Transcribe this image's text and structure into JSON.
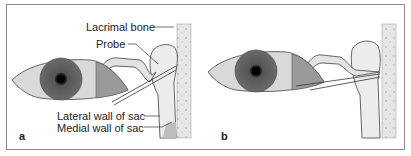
{
  "figure": {
    "panels": [
      {
        "id": "a",
        "label": "a",
        "annotations": {
          "lacrimal_bone": "Lacrimal bone",
          "probe": "Probe",
          "lateral_wall": "Lateral wall of sac",
          "medial_wall": "Medial wall of sac"
        }
      },
      {
        "id": "b",
        "label": "b"
      }
    ],
    "colors": {
      "frame": "#8a8a8a",
      "iris": "#6e6e6e",
      "sclera": "#d9d9d9",
      "lid": "#9a9a9a",
      "sac": "#e6e6e6",
      "bone": "#e8e8e8"
    }
  }
}
